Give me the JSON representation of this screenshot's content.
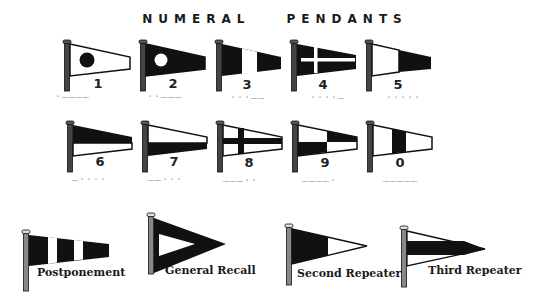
{
  "title": "NUMERAL PENDANTS",
  "colors": {
    "ink": "#1a1a1a",
    "paper": "#ffffff",
    "morse": "#a8a8a8"
  },
  "numeral_pendants": [
    {
      "numeral": "1",
      "design": "white pendant with black disc",
      "morse": "·————"
    },
    {
      "numeral": "2",
      "design": "black pendant with white disc",
      "morse": "··———"
    },
    {
      "numeral": "3",
      "design": "black-white-black vertical",
      "morse": "···——"
    },
    {
      "numeral": "4",
      "design": "black with white cross",
      "morse": "····—"
    },
    {
      "numeral": "5",
      "design": "white hoist, black fly",
      "morse": "·····"
    },
    {
      "numeral": "6",
      "design": "black over white horizontal",
      "morse": "—····"
    },
    {
      "numeral": "7",
      "design": "white over black horizontal",
      "morse": "——···"
    },
    {
      "numeral": "8",
      "design": "white with black cross",
      "morse": "———··"
    },
    {
      "numeral": "9",
      "design": "quartered white/black",
      "morse": "————·"
    },
    {
      "numeral": "0",
      "design": "white-black-white vertical",
      "morse": "—————"
    }
  ],
  "special_pendants": [
    {
      "label": "Postponement",
      "design": "black and white vertical stripes"
    },
    {
      "label": "General Recall",
      "design": "black triangle with white inner triangle"
    },
    {
      "label": "Second Repeater",
      "design": "black hoist, white fly triangle"
    },
    {
      "label": "Third Repeater",
      "design": "white triangle with black horizontal band"
    }
  ]
}
